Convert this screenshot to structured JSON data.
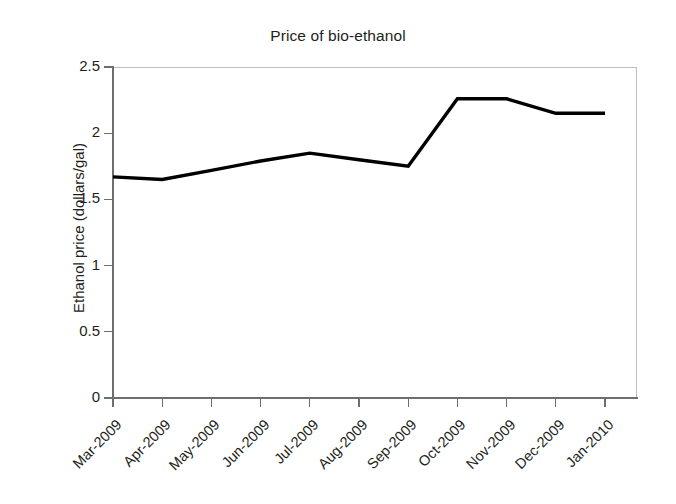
{
  "chart_data": {
    "type": "line",
    "title": "Price of bio-ethanol",
    "xlabel": "",
    "ylabel": "Ethanol price (dollars/gal)",
    "categories": [
      "Mar-2009",
      "Apr-2009",
      "May-2009",
      "Jun-2009",
      "Jul-2009",
      "Aug-2009",
      "Sep-2009",
      "Oct-2009",
      "Nov-2009",
      "Dec-2009",
      "Jan-2010"
    ],
    "values": [
      1.67,
      1.65,
      1.72,
      1.79,
      1.85,
      1.8,
      1.75,
      2.26,
      2.26,
      2.15,
      2.15
    ],
    "series": [
      {
        "name": "Ethanol price",
        "values": [
          1.67,
          1.65,
          1.72,
          1.79,
          1.85,
          1.8,
          1.75,
          2.26,
          2.26,
          2.15,
          2.15
        ]
      }
    ],
    "ylim": [
      0,
      2.5
    ],
    "yticks": [
      0,
      0.5,
      1,
      1.5,
      2,
      2.5
    ],
    "ytick_labels": [
      "0",
      "0.5",
      "1",
      "1.5",
      "2",
      "2.5"
    ],
    "grid": false,
    "legend": "none",
    "line_color": "#000000",
    "axis_color": "#6d6e71",
    "frame_color": "#bcbec0",
    "text_color": "#231f20",
    "xtick_rotation": -45
  }
}
